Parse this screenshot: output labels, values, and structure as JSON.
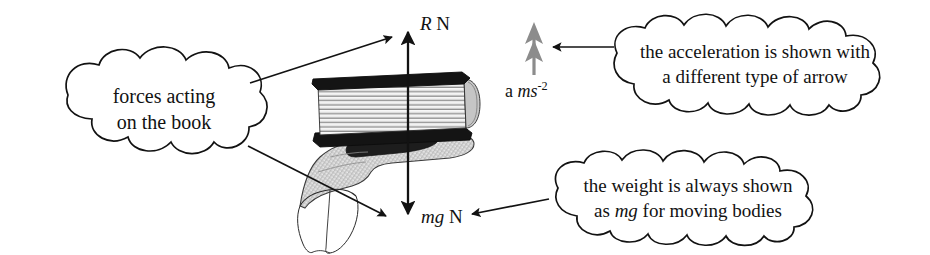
{
  "figure": {
    "background_color": "#ffffff",
    "ink_color": "#121212",
    "accel_arrow_color": "#8c8c8c"
  },
  "force_labels": {
    "normal_reaction": {
      "symbol": "R",
      "unit": "N",
      "full": "R N"
    },
    "weight": {
      "symbol": "mg",
      "unit": "N",
      "full": "mg N"
    },
    "acceleration": {
      "symbol": "a",
      "unit_base": "ms",
      "unit_exponent": "-2",
      "full": "a ms-2"
    }
  },
  "callouts": [
    {
      "name": "forces-acting-callout",
      "line1": "forces acting",
      "line2": "on the book"
    },
    {
      "name": "acceleration-arrow-callout",
      "line1": "the acceleration is shown with",
      "line2": "a different type of arrow"
    },
    {
      "name": "weight-mg-callout",
      "line1": "the weight is always shown",
      "line2_pre": "as ",
      "line2_em": "mg",
      "line2_post": " for moving bodies"
    }
  ],
  "illustration": {
    "object": "book",
    "support": "open hand",
    "book_cover_color": "#111111",
    "page_color": "#f2f2f2",
    "hand_fill": "#d4d4d4"
  }
}
